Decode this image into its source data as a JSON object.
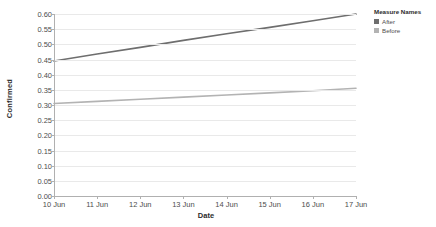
{
  "chart_data": {
    "type": "line",
    "title": "",
    "xlabel": "Date",
    "ylabel": "Confirmed",
    "x": [
      "10 Jun",
      "11 Jun",
      "12 Jun",
      "13 Jun",
      "14 Jun",
      "15 Jun",
      "16 Jun",
      "17 Jun"
    ],
    "ylim": [
      0.0,
      0.6
    ],
    "yticks": [
      "0.00",
      "0.05",
      "0.10",
      "0.15",
      "0.20",
      "0.25",
      "0.30",
      "0.35",
      "0.40",
      "0.45",
      "0.50",
      "0.55",
      "0.60"
    ],
    "ytick_values": [
      0.0,
      0.05,
      0.1,
      0.15,
      0.2,
      0.25,
      0.3,
      0.35,
      0.4,
      0.45,
      0.5,
      0.55,
      0.6
    ],
    "grid": true,
    "legend_position": "top-right",
    "series": [
      {
        "name": "After",
        "color": "#6e6e6e",
        "values": [
          0.445,
          0.468,
          0.49,
          0.513,
          0.535,
          0.556,
          0.578,
          0.6
        ]
      },
      {
        "name": "Before",
        "color": "#b3b3b3",
        "values": [
          0.305,
          0.312,
          0.319,
          0.326,
          0.333,
          0.34,
          0.347,
          0.355
        ]
      }
    ]
  },
  "legend": {
    "title": "Measure Names",
    "items": [
      {
        "label": "After",
        "color": "#6e6e6e"
      },
      {
        "label": "Before",
        "color": "#b3b3b3"
      }
    ]
  },
  "axes": {
    "y_title": "Confirmed",
    "x_title": "Date"
  }
}
